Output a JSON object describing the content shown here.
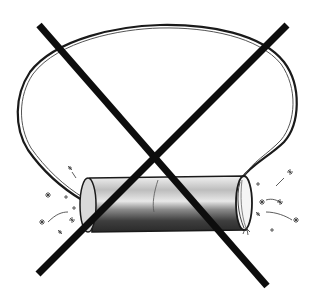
{
  "illustration": {
    "description": "Hand-drawn sketch of a cylindrical object (tube) attached to a large loop/balloon outline, crossed out with a large black X",
    "subject": "cylinder-with-loop",
    "overlay": "prohibition-x",
    "colors": {
      "background": "#ffffff",
      "ink": "#1a1a1a",
      "x_mark": "#0d0d0d",
      "shading_dark": "#3a3a3a",
      "shading_light": "#9a9a9a"
    }
  }
}
